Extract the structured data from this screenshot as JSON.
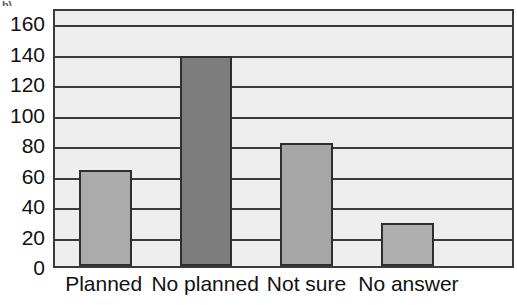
{
  "caption_stub": "b)",
  "chart_data": {
    "type": "bar",
    "title": "",
    "subtitle": "",
    "xlabel": "",
    "ylabel": "",
    "categories": [
      "Planned",
      "No planned",
      "Not sure",
      "No answer"
    ],
    "values": [
      63,
      138,
      81,
      28
    ],
    "series": [
      {
        "name": "Responses",
        "values": [
          63,
          138,
          81,
          28
        ]
      }
    ],
    "ylim": [
      0,
      170
    ],
    "y_ticks": [
      0,
      20,
      40,
      60,
      80,
      100,
      120,
      140,
      160
    ],
    "y_tick_labels": [
      "0",
      "20",
      "40",
      "60",
      "80",
      "100",
      "120",
      "140",
      "160"
    ],
    "grid": true,
    "grid_axis": "y",
    "legend": false,
    "legend_position": "none",
    "bar_colors": [
      "#ababab",
      "#7d7d7d",
      "#a6a6a6",
      "#b0b0b0"
    ],
    "bar_border_color": "#2e2e2e",
    "plot_background": "#eeeeee",
    "axis_color": "#3b3b3b",
    "bar_geometry": [
      {
        "category": "Planned",
        "center_pct": 11.0,
        "width_pct": 11.5
      },
      {
        "category": "No planned",
        "center_pct": 33.0,
        "width_pct": 11.5
      },
      {
        "category": "Not sure",
        "center_pct": 55.0,
        "width_pct": 11.5
      },
      {
        "category": "No answer",
        "center_pct": 77.1,
        "width_pct": 11.5
      }
    ]
  }
}
